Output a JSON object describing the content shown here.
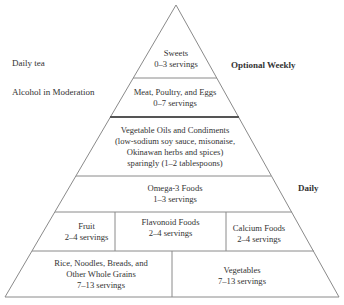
{
  "left_labels": {
    "daily_tea": "Daily tea",
    "alcohol": "Alcohol in Moderation"
  },
  "right_labels": {
    "optional_weekly": "Optional Weekly",
    "daily": "Daily"
  },
  "tiers": {
    "sweets": {
      "name": "Sweets",
      "servings": "0–3 servings"
    },
    "meat": {
      "name": "Meat, Poultry, and Eggs",
      "servings": "0–7 servings"
    },
    "oils": {
      "line1": "Vegetable Oils and Condiments",
      "line2": "(low-sodium soy sauce, misonaise,",
      "line3": "Okinawan herbs and spices)",
      "line4": "sparingly (1–2 tablespoons)"
    },
    "omega3": {
      "name": "Omega-3 Foods",
      "servings": "1–3 servings"
    },
    "fruit": {
      "name": "Fruit",
      "servings": "2–4 servings"
    },
    "flavonoid": {
      "name": "Flavonoid Foods",
      "servings": "2–4 servings"
    },
    "calcium": {
      "name": "Calcium Foods",
      "servings": "2–4 servings"
    },
    "grains": {
      "line1": "Rice, Noodles, Breads, and",
      "line2": "Other Whole Grains",
      "servings": "7–13 servings"
    },
    "vegetables": {
      "name": "Vegetables",
      "servings": "7–13 servings"
    }
  },
  "colors": {
    "line": "#8a8a8a",
    "thick_line": "#555555",
    "text": "#333333"
  }
}
